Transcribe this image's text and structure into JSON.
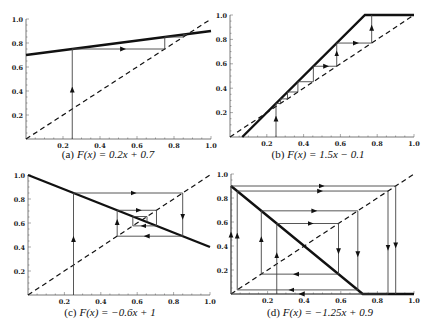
{
  "chart_data": [
    {
      "type": "line",
      "panel": "a",
      "title": "(a) F(x) = 0.2x + 0.7",
      "caption_prefix": "(a)",
      "caption_formula": "F(x) = 0.2x + 0.7",
      "function": {
        "slope": 0.2,
        "intercept": 0.7,
        "clip": [
          0,
          1
        ]
      },
      "x0": 0.25,
      "iterations": 4,
      "xlim": [
        0,
        1
      ],
      "ylim": [
        0,
        1
      ],
      "xticks": [
        "0.2",
        "0.4",
        "0.6",
        "0.8",
        "1.0"
      ],
      "yticks": [
        "0.2",
        "0.4",
        "0.6",
        "0.8",
        "1.0"
      ],
      "series": [
        {
          "name": "F(x)",
          "style": "thick solid",
          "x": [
            0,
            1
          ],
          "y": [
            0.7,
            0.9
          ]
        },
        {
          "name": "y = x",
          "style": "dashed",
          "x": [
            0,
            1
          ],
          "y": [
            0,
            1
          ]
        },
        {
          "name": "cobweb",
          "style": "thin with arrows",
          "x": [
            0.25,
            0.25,
            0.75,
            0.75,
            0.85,
            0.85,
            0.87
          ],
          "y": [
            0,
            0.75,
            0.75,
            0.85,
            0.85,
            0.87,
            0.87
          ]
        }
      ],
      "grid": false
    },
    {
      "type": "line",
      "panel": "b",
      "title": "(b) F(x) = 1.5x − 0.1",
      "caption_prefix": "(b)",
      "caption_formula": "F(x) = 1.5x − 0.1",
      "function": {
        "slope": 1.5,
        "intercept": -0.1,
        "clip": [
          0,
          1
        ]
      },
      "x0": 0.25,
      "iterations": 5,
      "xlim": [
        0,
        1
      ],
      "ylim": [
        0,
        1
      ],
      "xticks": [
        "0.2",
        "0.4",
        "0.6",
        "0.8",
        "1.0"
      ],
      "yticks": [
        "0.2",
        "0.4",
        "0.6",
        "0.8",
        "1.0"
      ],
      "series": [
        {
          "name": "F(x)",
          "style": "thick solid",
          "x": [
            0.0667,
            0.7333,
            1.0
          ],
          "y": [
            0,
            1,
            1
          ]
        },
        {
          "name": "y = x",
          "style": "dashed",
          "x": [
            0,
            1
          ],
          "y": [
            0,
            1
          ]
        },
        {
          "name": "cobweb",
          "style": "thin with arrows",
          "x": [
            0.25,
            0.25,
            0.275,
            0.275,
            0.3125,
            0.3125,
            0.369,
            0.369,
            0.453,
            0.453,
            0.58,
            0.58,
            0.77,
            0.77
          ],
          "y": [
            0,
            0.275,
            0.275,
            0.3125,
            0.3125,
            0.369,
            0.369,
            0.453,
            0.453,
            0.58,
            0.58,
            0.77,
            0.77,
            1.0
          ]
        }
      ],
      "grid": false
    },
    {
      "type": "line",
      "panel": "c",
      "title": "(c) F(x) = −0.6x + 1",
      "caption_prefix": "(c)",
      "caption_formula": "F(x) = −0.6x + 1",
      "function": {
        "slope": -0.6,
        "intercept": 1,
        "clip": [
          0,
          1
        ]
      },
      "x0": 0.25,
      "iterations": 8,
      "xlim": [
        0,
        1
      ],
      "ylim": [
        0,
        1
      ],
      "xticks": [
        "0.2",
        "0.4",
        "0.6",
        "0.8",
        "1.0"
      ],
      "yticks": [
        "0.2",
        "0.4",
        "0.6",
        "0.8",
        "1.0"
      ],
      "series": [
        {
          "name": "F(x)",
          "style": "thick solid",
          "x": [
            0,
            1
          ],
          "y": [
            1,
            0.4
          ]
        },
        {
          "name": "y = x",
          "style": "dashed",
          "x": [
            0,
            1
          ],
          "y": [
            0,
            1
          ]
        },
        {
          "name": "cobweb",
          "style": "thin with arrows",
          "x": [
            0.25,
            0.25,
            0.85,
            0.85,
            0.49,
            0.49,
            0.706,
            0.706,
            0.576,
            0.576,
            0.654,
            0.654
          ],
          "y": [
            0,
            0.85,
            0.85,
            0.49,
            0.49,
            0.706,
            0.706,
            0.576,
            0.576,
            0.654,
            0.654,
            0.607
          ]
        }
      ],
      "grid": false
    },
    {
      "type": "line",
      "panel": "d",
      "title": "(d) F(x) = −1.25x + 0.9",
      "caption_prefix": "(d)",
      "caption_formula": "F(x) = −1.25x + 0.9",
      "function": {
        "slope": -1.25,
        "intercept": 0.9,
        "clip": [
          0,
          1
        ]
      },
      "x0": 0.25,
      "iterations": 8,
      "xlim": [
        0,
        1
      ],
      "ylim": [
        0,
        1
      ],
      "xticks": [
        "0.2",
        "0.4",
        "0.6",
        "0.8",
        "1.0"
      ],
      "yticks": [
        "0.2",
        "0.4",
        "0.6",
        "0.8",
        "1.0"
      ],
      "series": [
        {
          "name": "F(x)",
          "style": "thick solid",
          "x": [
            0,
            0.72,
            1.0
          ],
          "y": [
            0.9,
            0,
            0
          ]
        },
        {
          "name": "y = x",
          "style": "dashed",
          "x": [
            0,
            1
          ],
          "y": [
            0,
            1
          ]
        },
        {
          "name": "cobweb",
          "style": "thin with arrows",
          "x": [
            0.25,
            0.25,
            0.5875,
            0.5875,
            0.1656,
            0.1656,
            0.693,
            0.693,
            0.034,
            0.034,
            0.858,
            0.858,
            0,
            0,
            0.9,
            0.9
          ],
          "y": [
            0,
            0.5875,
            0.5875,
            0.1656,
            0.1656,
            0.693,
            0.693,
            0.034,
            0.034,
            0.858,
            0.858,
            0,
            0,
            0.9,
            0.9,
            0
          ]
        }
      ],
      "grid": false
    }
  ],
  "panels": [
    {
      "id": "a",
      "caption_prefix": "(a)",
      "caption_formula": "F(x) = 0.2x + 0.7",
      "box": {
        "x0": 26,
        "x1": 211,
        "y0": 139,
        "y1": 19
      },
      "caption_x": 108,
      "caption_y": 158
    },
    {
      "id": "b",
      "caption_prefix": "(b)",
      "caption_formula": "F(x) = 1.5x − 0.1",
      "box": {
        "x0": 230,
        "x1": 414,
        "y0": 137,
        "y1": 15
      },
      "caption_x": 310,
      "caption_y": 158
    },
    {
      "id": "c",
      "caption_prefix": "(c)",
      "caption_formula": "F(x) = −0.6x + 1",
      "box": {
        "x0": 28,
        "x1": 210,
        "y0": 295,
        "y1": 175
      },
      "caption_x": 110,
      "caption_y": 316
    },
    {
      "id": "d",
      "caption_prefix": "(d)",
      "caption_formula": "F(x) = −1.25x + 0.9",
      "box": {
        "x0": 231,
        "x1": 414,
        "y0": 294,
        "y1": 174
      },
      "caption_x": 319,
      "caption_y": 316
    }
  ],
  "colors": {
    "curve": "#111111",
    "diagonal": "#111111",
    "cobweb": "#444444",
    "axis": "#555555",
    "text": "#222222"
  }
}
